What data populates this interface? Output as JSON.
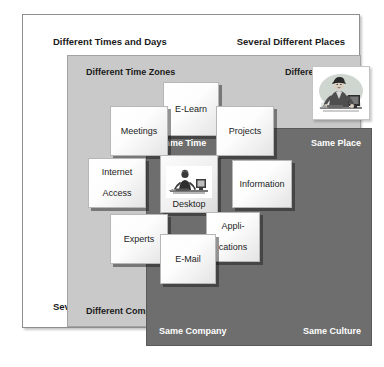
{
  "diagram": {
    "outer_frame": {
      "name": "outermost-context",
      "top_left": "Different Times and Days",
      "top_right": "Several Different  Places",
      "bottom_left": "Several Different Companies",
      "bottom_right": "Several Different Cultures"
    },
    "middle_frame": {
      "name": "middle-context",
      "top_left": "Different Time Zones",
      "top_right": "Different  Place",
      "bottom_left": "Different Company",
      "bottom_right": "Different Culture"
    },
    "inner_frame": {
      "name": "innermost-context",
      "top_left": "Same Time",
      "top_right": "Same Place",
      "bottom_left": "Same Company",
      "bottom_right": "Same Culture"
    },
    "tiles": [
      {
        "id": "e-learn",
        "label": "E-Learn"
      },
      {
        "id": "meetings",
        "label": "Meetings"
      },
      {
        "id": "projects",
        "label": "Projects"
      },
      {
        "id": "internet-access",
        "line1": "Internet",
        "line2": "Access"
      },
      {
        "id": "desktop",
        "label": "Desktop"
      },
      {
        "id": "information",
        "label": "Information"
      },
      {
        "id": "experts",
        "label": "Experts"
      },
      {
        "id": "applications",
        "line1": "Appli-",
        "line2": "cations"
      },
      {
        "id": "e-mail",
        "label": "E-Mail"
      }
    ],
    "illustrations": [
      {
        "id": "person-at-desk",
        "icon": "person-at-computer-icon"
      },
      {
        "id": "desktop-tile-art",
        "icon": "person-at-desk-icon"
      }
    ],
    "colors": {
      "page_background": "#ffffff",
      "outer_frame_fill": "#ffffff",
      "middle_frame_fill": "#c9c9c9",
      "inner_frame_fill": "#6e6e6e",
      "tile_fill": "#ffffff",
      "inner_label_text": "#ffffff",
      "outer_label_text": "#1a1a1a"
    }
  }
}
